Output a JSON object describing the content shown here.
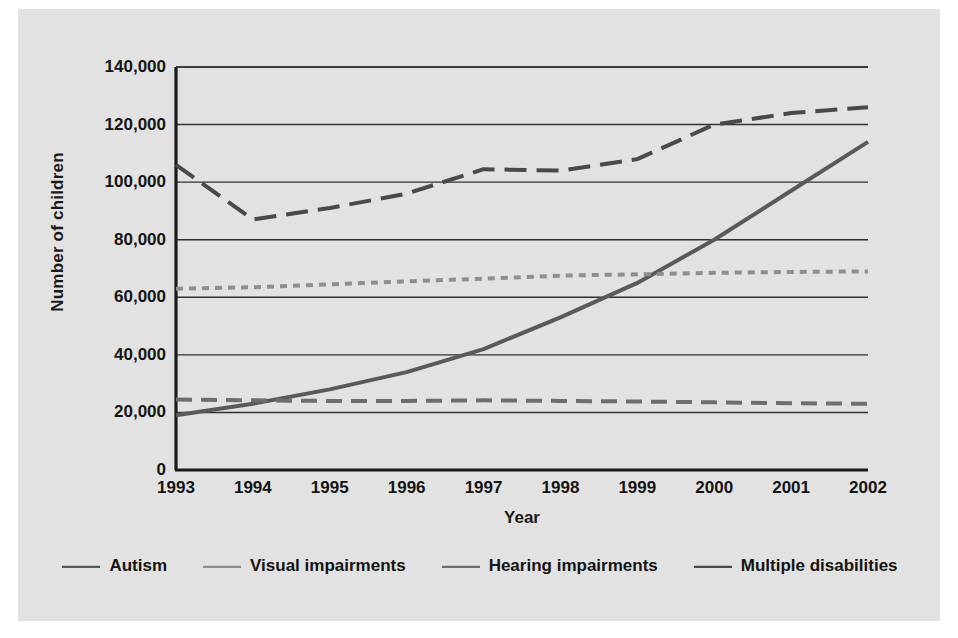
{
  "figure": {
    "background_color": "#e2e2e2",
    "plot_background_color": "#e2e2e2"
  },
  "axes": {
    "y_axis_title": "Number of children",
    "x_axis_title": "Year",
    "y_ticks": [
      "0",
      "20,000",
      "40,000",
      "60,000",
      "80,000",
      "100,000",
      "120,000",
      "140,000"
    ],
    "x_ticks": [
      "1993",
      "1994",
      "1995",
      "1996",
      "1997",
      "1998",
      "1999",
      "2000",
      "2001",
      "2002"
    ]
  },
  "legend": {
    "items": [
      {
        "label": "Autism",
        "color": "#5a5a5a",
        "dash": "none"
      },
      {
        "label": "Visual impairments",
        "color": "#8f8f8f",
        "dash": "short"
      },
      {
        "label": "Hearing impairments",
        "color": "#6e6e6e",
        "dash": "medium"
      },
      {
        "label": "Multiple disabilities",
        "color": "#4a4a4a",
        "dash": "long"
      }
    ]
  },
  "chart_data": {
    "type": "line",
    "title": "",
    "xlabel": "Year",
    "ylabel": "Number of children",
    "x": [
      1993,
      1994,
      1995,
      1996,
      1997,
      1998,
      1999,
      2000,
      2001,
      2002
    ],
    "xlim": [
      1993,
      2002
    ],
    "ylim": [
      0,
      140000
    ],
    "ytick_step": 20000,
    "grid": "horizontal",
    "legend_position": "bottom",
    "series": [
      {
        "name": "Autism",
        "color": "#5a5a5a",
        "dash": "none",
        "values": [
          19000,
          23000,
          28000,
          34000,
          42000,
          53000,
          65000,
          80000,
          97000,
          114000
        ]
      },
      {
        "name": "Visual impairments",
        "color": "#8f8f8f",
        "dash": "short",
        "values": [
          63000,
          63500,
          64500,
          65500,
          66500,
          67500,
          68000,
          68500,
          68800,
          69000
        ]
      },
      {
        "name": "Hearing impairments",
        "color": "#6e6e6e",
        "dash": "medium",
        "values": [
          24500,
          24200,
          24000,
          24000,
          24200,
          24000,
          23800,
          23500,
          23200,
          23000
        ]
      },
      {
        "name": "Multiple disabilities",
        "color": "#4a4a4a",
        "dash": "long",
        "values": [
          106000,
          87000,
          91000,
          96000,
          104500,
          104000,
          108000,
          120000,
          124000,
          126000
        ]
      }
    ]
  }
}
